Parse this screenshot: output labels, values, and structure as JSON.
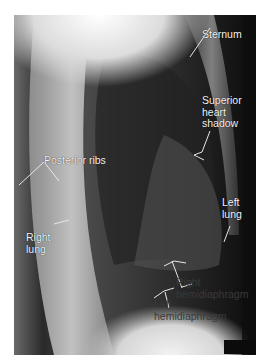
{
  "figure": {
    "labels": {
      "sternum": "Sternum",
      "superior_heart_shadow": "Superior\nheart\nshadow",
      "posterior_ribs": "Posterior ribs",
      "right_lung": "Right\nlung",
      "left_lung": "Left\nlung",
      "right_hemidiaphragm": "Right\nhemidiaphragm",
      "left_hemidiaphragm": "Left\nhemidiaphragm"
    }
  }
}
